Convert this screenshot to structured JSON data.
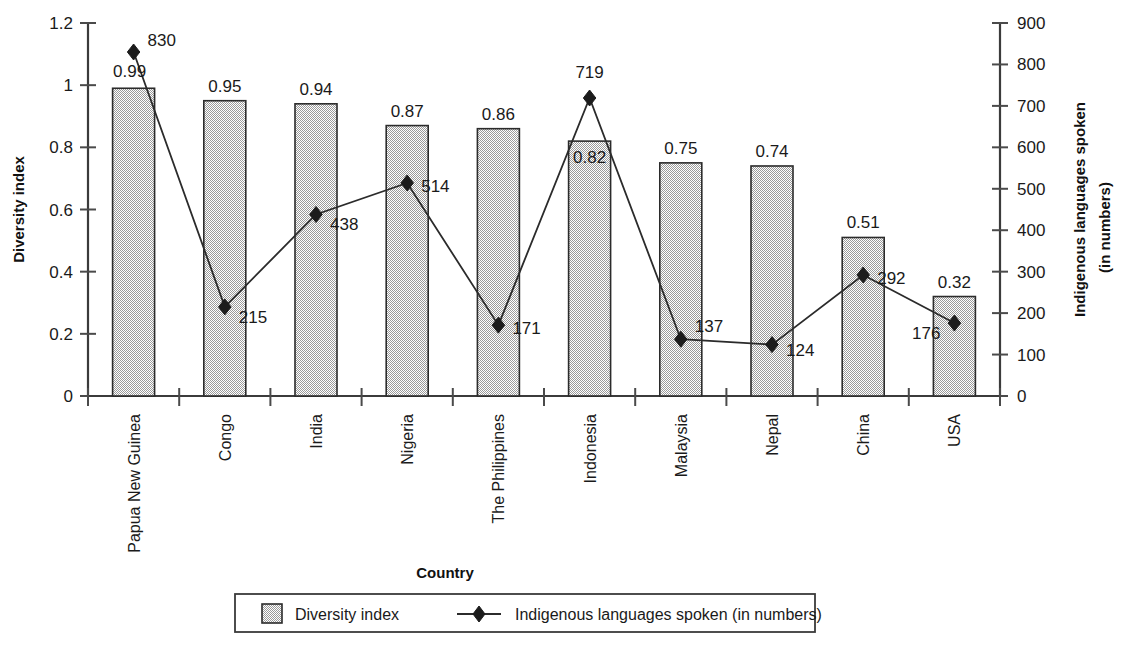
{
  "chart_data": {
    "type": "bar",
    "title": "",
    "xlabel": "Country",
    "ylabel": "Diversity index",
    "y2label_line1": "Indigenous languages spoken",
    "y2label_line2": "(in numbers)",
    "grid": false,
    "legend_position": "bottom",
    "categories": [
      "Papua New Guinea",
      "Congo",
      "India",
      "Nigeria",
      "The Philippines",
      "Indonesia",
      "Malaysia",
      "Nepal",
      "China",
      "USA"
    ],
    "ylim": [
      0,
      1.2
    ],
    "y2lim": [
      0,
      900
    ],
    "yticks": [
      "0",
      "0.2",
      "0.4",
      "0.6",
      "0.8",
      "1",
      "1.2"
    ],
    "ytick_values": [
      0,
      0.2,
      0.4,
      0.6,
      0.8,
      1,
      1.2
    ],
    "y2ticks": [
      "0",
      "100",
      "200",
      "300",
      "400",
      "500",
      "600",
      "700",
      "800",
      "900"
    ],
    "y2tick_values": [
      0,
      100,
      200,
      300,
      400,
      500,
      600,
      700,
      800,
      900
    ],
    "series": [
      {
        "name": "Diversity index",
        "type": "bar",
        "axis": "left",
        "values": [
          0.99,
          0.95,
          0.94,
          0.87,
          0.86,
          0.82,
          0.75,
          0.74,
          0.51,
          0.32
        ],
        "labels": [
          "0.99",
          "0.95",
          "0.94",
          "0.87",
          "0.86",
          "0.82",
          "0.75",
          "0.74",
          "0.51",
          "0.32"
        ],
        "color": "#d9d9d9"
      },
      {
        "name": "Indigenous languages spoken (in numbers)",
        "type": "line",
        "axis": "right",
        "values": [
          830,
          215,
          438,
          514,
          171,
          719,
          137,
          124,
          292,
          176
        ],
        "labels": [
          "830",
          "215",
          "438",
          "514",
          "171",
          "719",
          "137",
          "124",
          "292",
          "176"
        ],
        "color": "#1c1c1c"
      }
    ]
  },
  "legend": {
    "items": [
      {
        "label": "Diversity index",
        "marker": "filled-square-swatch"
      },
      {
        "label": "Indigenous languages spoken (in numbers)",
        "marker": "line-with-diamond"
      }
    ]
  }
}
